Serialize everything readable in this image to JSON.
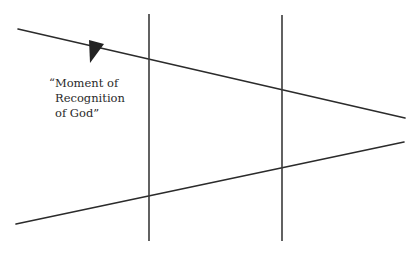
{
  "diagram": {
    "type": "line-diagram",
    "canvas": {
      "width": 420,
      "height": 254,
      "background": "#ffffff"
    },
    "stroke_color": "#2b2b2b",
    "annotation": {
      "lines": [
        "“Moment of",
        "Recognition",
        "of God”"
      ]
    },
    "elements": {
      "top_diagonal": {
        "x1": 18,
        "y1": 29,
        "x2": 405,
        "y2": 118
      },
      "bottom_diagonal": {
        "x1": 16,
        "y1": 224,
        "x2": 404,
        "y2": 142
      },
      "left_vertical": {
        "x": 149,
        "y1": 14,
        "y2": 241
      },
      "right_vertical": {
        "x": 282,
        "y1": 15,
        "y2": 241
      },
      "arrowhead": {
        "points": "89,40 104,44 90,63",
        "direction": "down-right, along top line"
      }
    }
  }
}
